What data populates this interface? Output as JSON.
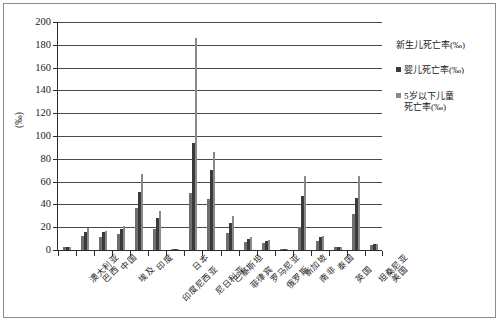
{
  "chart_data": {
    "type": "bar",
    "title": "",
    "xlabel": "",
    "ylabel": "(‰)",
    "ylim": [
      0,
      200
    ],
    "ytick_step": 20,
    "grid": true,
    "legend_position": "right",
    "yticks": [
      "200",
      "180",
      "160",
      "140",
      "120",
      "100",
      "80",
      "60",
      "40",
      "20",
      "0"
    ],
    "categories": [
      "澳大利亚",
      "巴西",
      "中国",
      "埃及",
      "印度",
      "印度尼西亚",
      "日本",
      "尼日利亚",
      "巴基斯坦",
      "菲律宾",
      "罗马尼亚",
      "俄罗斯",
      "新加坡",
      "南非",
      "泰国",
      "英国",
      "坦桑尼亚",
      "美国"
    ],
    "series": [
      {
        "name": "新生儿死亡率(‰)",
        "color": "#6f6f6f",
        "values": [
          3,
          12,
          11,
          14,
          37,
          18,
          1,
          50,
          45,
          15,
          7,
          6,
          1,
          20,
          8,
          3,
          32,
          4
        ]
      },
      {
        "name": "婴儿死亡率(‰)",
        "color": "#3a3a3a",
        "values": [
          3,
          16,
          16,
          18,
          51,
          28,
          1,
          94,
          70,
          24,
          10,
          8,
          1,
          47,
          11,
          3,
          46,
          5
        ]
      },
      {
        "name": "5岁以下儿童死亡率(‰)",
        "color": "#8a8a8a",
        "values": [
          3,
          19,
          17,
          21,
          67,
          34,
          1,
          186,
          86,
          30,
          11,
          9,
          1,
          65,
          12,
          3,
          65,
          5
        ]
      }
    ]
  },
  "legend": {
    "items": [
      {
        "label": "新生儿死亡率(‰)",
        "label2": "",
        "has_swatch": false,
        "color": "#6f6f6f"
      },
      {
        "label": "婴儿死亡率(‰)",
        "label2": "",
        "has_swatch": true,
        "color": "#3a3a3a"
      },
      {
        "label": "5岁以下儿童",
        "label2": "死亡率(‰)",
        "has_swatch": true,
        "color": "#8a8a8a"
      }
    ]
  },
  "axis": {
    "y_title": "(‰)"
  }
}
